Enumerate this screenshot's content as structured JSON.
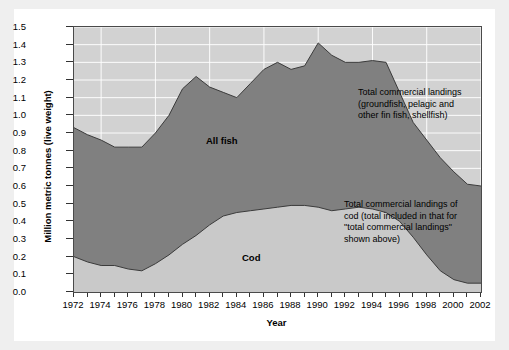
{
  "chart_data": {
    "type": "area",
    "title": "",
    "xlabel": "Year",
    "ylabel": "Million metric tonnes (live weight)",
    "xlim": [
      1972,
      2002
    ],
    "ylim": [
      0.0,
      1.5
    ],
    "grid": true,
    "legend_position": "in-plot labels",
    "x": [
      1972,
      1973,
      1974,
      1975,
      1976,
      1977,
      1978,
      1979,
      1980,
      1981,
      1982,
      1983,
      1984,
      1985,
      1986,
      1987,
      1988,
      1989,
      1990,
      1991,
      1992,
      1993,
      1994,
      1995,
      1996,
      1997,
      1998,
      1999,
      2000,
      2001,
      2002
    ],
    "series": [
      {
        "name": "All fish",
        "label": "All fish",
        "color": "#808080",
        "values": [
          0.93,
          0.89,
          0.86,
          0.82,
          0.82,
          0.82,
          0.9,
          1.0,
          1.15,
          1.22,
          1.16,
          1.13,
          1.1,
          1.18,
          1.26,
          1.3,
          1.26,
          1.28,
          1.41,
          1.34,
          1.3,
          1.3,
          1.31,
          1.3,
          1.13,
          0.96,
          0.86,
          0.76,
          0.68,
          0.61,
          0.6
        ]
      },
      {
        "name": "Cod",
        "label": "Cod",
        "color": "#c9c9c9",
        "values": [
          0.2,
          0.17,
          0.15,
          0.15,
          0.13,
          0.12,
          0.16,
          0.21,
          0.27,
          0.32,
          0.38,
          0.43,
          0.45,
          0.46,
          0.47,
          0.48,
          0.49,
          0.49,
          0.48,
          0.46,
          0.47,
          0.48,
          0.47,
          0.45,
          0.4,
          0.31,
          0.21,
          0.12,
          0.07,
          0.05,
          0.05
        ]
      }
    ],
    "x_tick_labels": [
      "1972",
      "1974",
      "1976",
      "1978",
      "1980",
      "1982",
      "1984",
      "1986",
      "1988",
      "1990",
      "1992",
      "1994",
      "1996",
      "1998",
      "2000",
      "2002"
    ],
    "y_tick_labels": [
      "0.0",
      "0.1",
      "0.2",
      "0.3",
      "0.4",
      "0.5",
      "0.6",
      "0.7",
      "0.8",
      "0.9",
      "1.0",
      "1.1",
      "1.2",
      "1.3",
      "1.4",
      "1.5"
    ],
    "annotations": [
      {
        "id": "total-landings",
        "lines": [
          "Total commercial landings",
          "(groundfish, pelagic and",
          "other fin fish, shellfish)"
        ]
      },
      {
        "id": "cod-landings",
        "lines": [
          "Total commercial landings of",
          "cod (total included in that for",
          "\"total commercial landings\"",
          "shown above)"
        ]
      }
    ]
  },
  "colors": {
    "page_background": "#efefef",
    "figure_background": "#ffffff",
    "plot_background": "#d2d2d2",
    "gridline": "#ffffff",
    "all_fish_fill": "#808080",
    "cod_fill": "#c9c9c9",
    "axis": "#4a4a4a",
    "text": "#000000"
  }
}
